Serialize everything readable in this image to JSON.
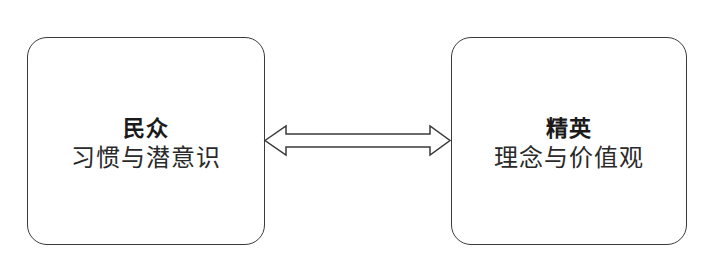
{
  "diagram": {
    "left_node": {
      "title": "民众",
      "subtitle": "习惯与潜意识"
    },
    "right_node": {
      "title": "精英",
      "subtitle": "理念与价值观"
    },
    "connector": {
      "type": "double-headed-arrow",
      "from": "left_node",
      "to": "right_node"
    },
    "colors": {
      "stroke": "#3a3a3a",
      "fill": "#ffffff",
      "text": "#1a1a1a"
    }
  }
}
